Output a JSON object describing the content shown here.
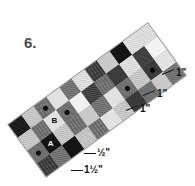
{
  "problem": {
    "number": "6."
  },
  "figure": {
    "type": "quilt-strip-diagram",
    "rotation_degrees": -36,
    "grid": {
      "columns": 11,
      "rows": 4
    },
    "patch_labels": [
      {
        "id": "A",
        "text": "A",
        "col": 1,
        "row": 3,
        "on": "dark"
      },
      {
        "id": "B",
        "text": "B",
        "col": 5,
        "row": 2,
        "on": "light"
      }
    ],
    "palette": {
      "black": "#141414",
      "dark": "#3b3b3b",
      "mid": "#6f6f6f",
      "mid_alt": "#8c8c8c",
      "light": "#c9c9c9",
      "pale": "#e2e2e2",
      "white": "#f2f2f2",
      "sashing": "#bdbdbd",
      "outline": "#8a8a8a"
    },
    "cells": [
      "black",
      "light",
      "mid dot",
      "pale",
      "mid",
      "pale",
      "dark",
      "light",
      "black",
      "pale",
      "pale",
      "light",
      "mid",
      "pale",
      "mid dot",
      "white",
      "dark",
      "mid",
      "dark",
      "pale",
      "dark",
      "white",
      "mid dot",
      "black",
      "light",
      "mid",
      "light",
      "mid",
      "pale",
      "mid dot",
      "light",
      "dark dot",
      "pale",
      "dark",
      "mid",
      "black",
      "light",
      "mid",
      "pale",
      "light",
      "dark",
      "mid",
      "light",
      "mid"
    ]
  },
  "callouts": [
    {
      "id": "inch-top",
      "text": "1\""
    },
    {
      "id": "inch-mid",
      "text": "1\""
    },
    {
      "id": "inch-low",
      "text": "1\""
    },
    {
      "id": "half-inch",
      "text": "½\""
    },
    {
      "id": "one-half-inch",
      "text": "1½\""
    }
  ]
}
